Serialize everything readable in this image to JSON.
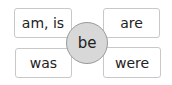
{
  "center": {
    "label": "be"
  },
  "forms": [
    {
      "label": "am, is",
      "position": "top-left"
    },
    {
      "label": "are",
      "position": "top-right"
    },
    {
      "label": "was",
      "position": "bottom-left"
    },
    {
      "label": "were",
      "position": "bottom-right"
    }
  ],
  "colors": {
    "circle_fill": "#d8d8d8",
    "circle_border": "#9a9a9a",
    "box_border": "#c8c8c8"
  }
}
